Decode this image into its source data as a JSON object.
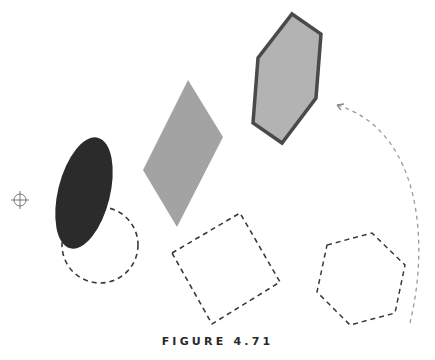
{
  "figure": {
    "caption": "FIGURE 4.71"
  },
  "colors": {
    "ellipse_fill": "#2b2b2b",
    "diamond_fill": "#a3a3a3",
    "hexagon_fill": "#b3b3b3",
    "hexagon_stroke": "#4a4a4a",
    "dashed_stroke": "#3a3a3a",
    "arrow_stroke": "#9a9a9a"
  },
  "shapes": [
    {
      "name": "filled-ellipse",
      "type": "ellipse",
      "cx": 84,
      "cy": 193,
      "rx": 26,
      "ry": 57,
      "rotate": 14
    },
    {
      "name": "filled-diamond",
      "type": "polygon",
      "points": "188,80 223,137 177,227 143,170"
    },
    {
      "name": "filled-hexagon",
      "type": "polygon",
      "points": "292,14 321,34 316,98 282,143 253,123 258,58"
    },
    {
      "name": "dashed-circle",
      "type": "circle",
      "cx": 100,
      "cy": 245,
      "r": 38
    },
    {
      "name": "dashed-square",
      "type": "polygon",
      "points": "172,253 240,213 280,282 212,324"
    },
    {
      "name": "dashed-hexagon",
      "type": "polygon",
      "points": "327,245 372,233 405,265 395,313 350,325 317,292"
    },
    {
      "name": "dashed-arrow",
      "type": "path",
      "d": "M 410 323 C 430 240, 420 130, 337 105"
    },
    {
      "name": "crosshair",
      "type": "icon",
      "cx": 20,
      "cy": 200,
      "r": 6
    }
  ]
}
